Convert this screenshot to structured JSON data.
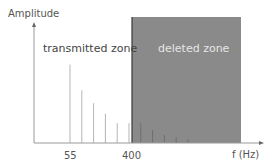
{
  "chart_data": {
    "type": "bar",
    "title": "",
    "xlabel": "f (Hz)",
    "ylabel": "Amplitude",
    "x_ticks": [
      {
        "value": 55,
        "label": "55"
      },
      {
        "value": 400,
        "label": "400"
      }
    ],
    "x_scale": "harmonic-index",
    "cutoff_frequency": 400,
    "zones": [
      {
        "name": "transmitted zone",
        "range": "below 400 Hz",
        "color": "#ffffff",
        "text_color": "#444444"
      },
      {
        "name": "deleted zone",
        "range": "above 400 Hz",
        "color": "#8a8a8a",
        "text_color": "#e6e6e6"
      }
    ],
    "series": [
      {
        "name": "harmonics",
        "note": "relative amplitudes (fundamental = 1.0), harmonics evenly spaced",
        "harmonic_index": [
          1,
          2,
          3,
          4,
          5,
          6,
          7,
          8,
          9,
          10,
          11
        ],
        "values": [
          0.67,
          0.45,
          0.34,
          0.25,
          0.17,
          0.17,
          0.17,
          0.11,
          0.07,
          0.05,
          0.03
        ],
        "zone": [
          "transmitted",
          "transmitted",
          "transmitted",
          "transmitted",
          "transmitted",
          "transmitted",
          "deleted",
          "deleted",
          "deleted",
          "deleted",
          "deleted"
        ]
      }
    ],
    "ylim": [
      0,
      1
    ],
    "grid": false,
    "legend": "none"
  },
  "labels": {
    "y_axis": "Amplitude",
    "x_axis": "f (Hz)",
    "transmitted": "transmitted zone",
    "deleted": "deleted zone",
    "tick_55": "55",
    "tick_400": "400"
  },
  "colors": {
    "axis": "#9a9a9a",
    "line_transmitted": "#b5b5b5",
    "line_deleted": "#6e6e6e",
    "deleted_zone": "#8a8a8a",
    "deleted_edge": "#3a3a3a"
  }
}
